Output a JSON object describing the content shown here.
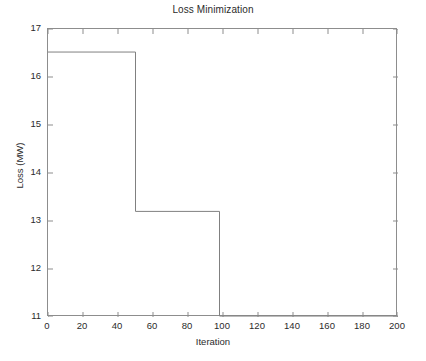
{
  "chart_data": {
    "type": "line",
    "title": "Loss Minimization",
    "xlabel": "Iteration",
    "ylabel": "Loss (MW)",
    "xlim": [
      0,
      200
    ],
    "ylim": [
      11,
      17
    ],
    "xticks": [
      0,
      20,
      40,
      60,
      80,
      100,
      120,
      140,
      160,
      180,
      200
    ],
    "yticks": [
      11,
      12,
      13,
      14,
      15,
      16,
      17
    ],
    "xtick_labels": [
      "0",
      "20",
      "40",
      "60",
      "80",
      "100",
      "120",
      "140",
      "160",
      "180",
      "200"
    ],
    "ytick_labels": [
      "11",
      "12",
      "13",
      "14",
      "15",
      "16",
      "17"
    ],
    "grid": false,
    "legend": null,
    "series": [
      {
        "name": "Loss",
        "style": "step-post",
        "color": "#808080",
        "linewidth": 1,
        "x": [
          0,
          50,
          50,
          98,
          98,
          200
        ],
        "y": [
          16.52,
          16.52,
          13.2,
          13.2,
          11.02,
          11.02
        ],
        "steps": [
          {
            "x_start": 0,
            "x_end": 50,
            "value": 16.52
          },
          {
            "x_start": 50,
            "x_end": 98,
            "value": 13.2
          },
          {
            "x_start": 98,
            "x_end": 200,
            "value": 11.02
          }
        ]
      }
    ]
  },
  "figure": {
    "background": "#ffffff",
    "axes_color": "#8d8d8d",
    "text_color": "#2b2b2b"
  }
}
